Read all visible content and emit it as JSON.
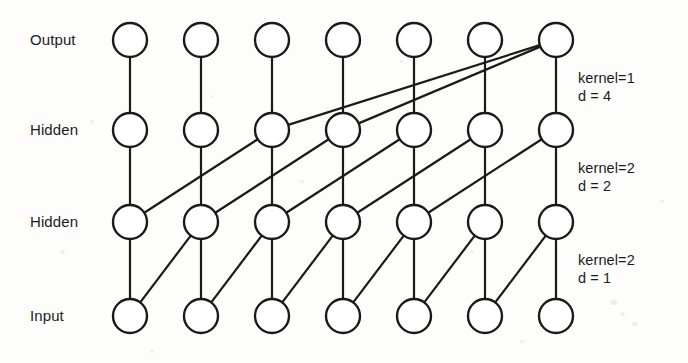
{
  "figure": {
    "background_color": "#fdfdfb",
    "stroke_color": "#1a1a1a",
    "node_fill": "#ffffff"
  },
  "layers": [
    {
      "id": "output",
      "label": "Output",
      "y": 40,
      "node_count": 7
    },
    {
      "id": "hidden2",
      "label": "Hidden",
      "y": 130,
      "node_count": 7
    },
    {
      "id": "hidden1",
      "label": "Hidden",
      "y": 222,
      "node_count": 7
    },
    {
      "id": "input",
      "label": "Input",
      "y": 316,
      "node_count": 7
    }
  ],
  "geometry": {
    "first_node_x": 130,
    "node_spacing": 71,
    "node_radius": 17,
    "label_x": 30
  },
  "annotations": [
    {
      "id": "top",
      "kernel_label": "kernel=1",
      "dilation_label": "d = 4",
      "x": 578,
      "y": 70
    },
    {
      "id": "middle",
      "kernel_label": "kernel=2",
      "dilation_label": "d = 2",
      "x": 578,
      "y": 160
    },
    {
      "id": "bottom",
      "kernel_label": "kernel=2",
      "dilation_label": "d = 1",
      "x": 578,
      "y": 252
    }
  ],
  "connection_blocks": [
    {
      "id": "input-to-hidden1",
      "from_layer": "input",
      "to_layer": "hidden1",
      "kernel": 2,
      "dilation": 1,
      "edges": [
        [
          0,
          0
        ],
        [
          1,
          1
        ],
        [
          2,
          2
        ],
        [
          3,
          3
        ],
        [
          4,
          4
        ],
        [
          5,
          5
        ],
        [
          6,
          6
        ],
        [
          0,
          1
        ],
        [
          1,
          2
        ],
        [
          2,
          3
        ],
        [
          3,
          4
        ],
        [
          4,
          5
        ],
        [
          5,
          6
        ]
      ]
    },
    {
      "id": "hidden1-to-hidden2",
      "from_layer": "hidden1",
      "to_layer": "hidden2",
      "kernel": 2,
      "dilation": 2,
      "edges": [
        [
          0,
          0
        ],
        [
          1,
          1
        ],
        [
          2,
          2
        ],
        [
          3,
          3
        ],
        [
          4,
          4
        ],
        [
          5,
          5
        ],
        [
          6,
          6
        ],
        [
          0,
          2
        ],
        [
          1,
          3
        ],
        [
          2,
          4
        ],
        [
          3,
          5
        ],
        [
          4,
          6
        ]
      ]
    },
    {
      "id": "hidden2-to-output",
      "from_layer": "hidden2",
      "to_layer": "output",
      "kernel": 1,
      "dilation": 4,
      "edges": [
        [
          0,
          0
        ],
        [
          1,
          1
        ],
        [
          2,
          2
        ],
        [
          3,
          3
        ],
        [
          4,
          4
        ],
        [
          5,
          5
        ],
        [
          6,
          6
        ],
        [
          2,
          6
        ],
        [
          3,
          6
        ]
      ]
    }
  ]
}
